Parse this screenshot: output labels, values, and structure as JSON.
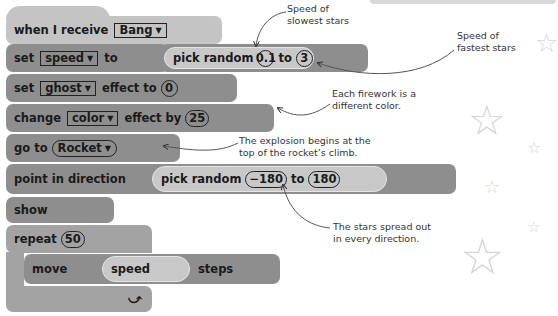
{
  "script": {
    "hat": {
      "label": "when I receive",
      "message": "Bang"
    },
    "set_var": {
      "label": "set",
      "variable": "speed",
      "to": "to",
      "reporter": {
        "label": "pick random",
        "from": "0.1",
        "to_label": "to",
        "to": "3"
      }
    },
    "set_effect": {
      "label": "set",
      "effect": "ghost",
      "suffix": "effect to",
      "value": "0"
    },
    "change_effect": {
      "label": "change",
      "effect": "color",
      "suffix": "effect by",
      "value": "25"
    },
    "goto": {
      "label": "go to",
      "target": "Rocket"
    },
    "point": {
      "label": "point in direction",
      "reporter": {
        "label": "pick random",
        "from": "−180",
        "to_label": "to",
        "to": "180"
      }
    },
    "show": {
      "label": "show"
    },
    "repeat": {
      "label": "repeat",
      "count": "50",
      "loop_icon": "⤻"
    },
    "move": {
      "label": "move",
      "variable": "speed",
      "suffix": "steps"
    },
    "dropdown_arrow": "▼"
  },
  "annotations": {
    "slowest": [
      "Speed of",
      "slowest stars"
    ],
    "fastest": [
      "Speed of",
      "fastest stars"
    ],
    "color": [
      "Each firework is a",
      "different color."
    ],
    "explosion": [
      "The explosion begins at the",
      "top of the rocket’s climb."
    ],
    "spread": [
      "The stars spread out",
      "in every direction."
    ]
  },
  "colors": {
    "light_block": "#c4c4c4",
    "dark_block": "#8e8e8e",
    "mid_block": "#a3a3a3"
  }
}
